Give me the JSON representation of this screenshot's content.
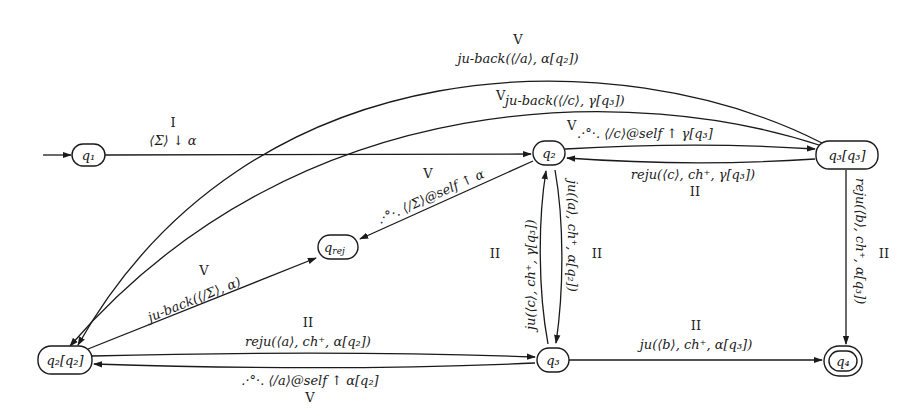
{
  "diagram": {
    "type": "state-machine",
    "nodes": [
      {
        "id": "q1",
        "label": "q₁",
        "initial": true
      },
      {
        "id": "q2",
        "label": "q₂"
      },
      {
        "id": "q3q3",
        "label": "q₃[q₃]"
      },
      {
        "id": "qrej",
        "label": "q_rej"
      },
      {
        "id": "q2q2",
        "label": "q₂[q₂]"
      },
      {
        "id": "q3",
        "label": "q₃"
      },
      {
        "id": "q4",
        "label": "q₄",
        "accepting": true
      }
    ],
    "edges": [
      {
        "from": "q1",
        "to": "q2",
        "phase": "I",
        "label": "⟨Σ⟩ ↓ α"
      },
      {
        "from": "q3q3",
        "to": "q2q2",
        "phase": "V",
        "label": "ju-back(⟨/a⟩, α[q₂])"
      },
      {
        "from": "q3q3",
        "to": "q2q2",
        "phase": "V",
        "label": "ju-back(⟨/c⟩, γ[q₃])"
      },
      {
        "from": "q2",
        "to": "q3q3",
        "phase": "V",
        "label": ".·°·. ⟨/c⟩@self ↑ γ[q₃]"
      },
      {
        "from": "q3q3",
        "to": "q2",
        "phase": "II",
        "label": "reju(⟨c⟩, ch⁺, γ[q₃])"
      },
      {
        "from": "q2",
        "to": "qrej",
        "phase": "V",
        "label": ".·°·. ⟨/Σ⟩@self ↑ α"
      },
      {
        "from": "q2q2",
        "to": "qrej",
        "phase": "V",
        "label": "ju-back(⟨/Σ⟩, α)"
      },
      {
        "from": "q3",
        "to": "q2",
        "phase": "II",
        "label": "ju(⟨c⟩, ch⁺, γ[q₃])"
      },
      {
        "from": "q2",
        "to": "q3",
        "phase": "II",
        "label": "ju(⟨a⟩, ch⁺, α[q₂])"
      },
      {
        "from": "q2q2",
        "to": "q3",
        "phase": "II",
        "label": "reju(⟨a⟩, ch⁺, α[q₂])"
      },
      {
        "from": "q3",
        "to": "q2q2",
        "phase": "V",
        "label": ".·°·. ⟨/a⟩@self ↑ α[q₂]"
      },
      {
        "from": "q3",
        "to": "q4",
        "phase": "II",
        "label": "ju(⟨b⟩, ch⁺, α[q₃])"
      },
      {
        "from": "q3q3",
        "to": "q4",
        "phase": "II",
        "label": "reju(⟨b⟩, ch⁺, α[q₃])"
      }
    ]
  },
  "text": {
    "q1": "q₁",
    "q2": "q₂",
    "q3q3": "q₃[q₃]",
    "qrej_main": "q",
    "qrej_sub": "rej",
    "q2q2": "q₂[q₂]",
    "q3": "q₃",
    "q4": "q₄",
    "e_q1_q2_phase": "I",
    "e_q1_q2_label": "⟨Σ⟩ ↓ α",
    "e_top1_phase": "V",
    "e_top1_label": "ju-back(⟨/a⟩, α[q₂])",
    "e_top2_phase": "V",
    "e_top2_label": "ju-back(⟨/c⟩, γ[q₃])",
    "e_q2_q3q3_phase": "V",
    "e_q2_q3q3_label": ".·°·. ⟨/c⟩@self ↑ γ[q₃]",
    "e_q3q3_q2_label": "reju(⟨c⟩, ch⁺, γ[q₃])",
    "e_q3q3_q2_phase": "II",
    "e_q2_qrej_phase": "V",
    "e_q2_qrej_label": ".·°·. ⟨/Σ⟩@self ↑ α",
    "e_q2q2_qrej_phase": "V",
    "e_q2q2_qrej_label": "ju-back(⟨/Σ⟩, α)",
    "e_q3_q2_phase": "II",
    "e_q3_q2_label": "ju(⟨c⟩, ch⁺, γ[q₃])",
    "e_q2_q3_phase": "II",
    "e_q2_q3_label": "ju(⟨a⟩, ch⁺, α[q₂])",
    "e_q2q2_q3_phase": "II",
    "e_q2q2_q3_label": "reju(⟨a⟩, ch⁺, α[q₂])",
    "e_q3_q2q2_label": ".·°·. ⟨/a⟩@self ↑ α[q₂]",
    "e_q3_q2q2_phase": "V",
    "e_q3_q4_phase": "II",
    "e_q3_q4_label": "ju(⟨b⟩, ch⁺, α[q₃])",
    "e_q3q3_q4_label": "reju(⟨b⟩, ch⁺, α[q₃])",
    "e_q3q3_q4_phase": "II"
  }
}
